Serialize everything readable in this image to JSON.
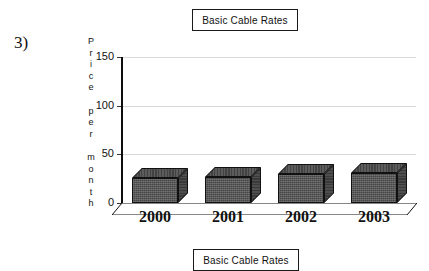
{
  "question_number": "3)",
  "chart_title_box": "Basic Cable Rates",
  "chart_caption_box": "Basic Cable Rates",
  "y_axis_title_letters": [
    "P",
    "r",
    "i",
    "c",
    "e",
    "",
    "p",
    "e",
    "r",
    "",
    "m",
    "o",
    "n",
    "t",
    "h"
  ],
  "chart_data": {
    "type": "bar",
    "title": "Basic Cable Rates",
    "xlabel": "",
    "ylabel": "Price per month",
    "categories": [
      "2000",
      "2001",
      "2002",
      "2003"
    ],
    "values": [
      26,
      27,
      30,
      31
    ],
    "yticks": [
      0,
      50,
      100,
      150
    ],
    "ylim": [
      0,
      150
    ],
    "grid": true,
    "legend": false,
    "style_3d": true,
    "bar_color": "#555555",
    "gridline_color": "#d9d9d9",
    "axis_color": "#0d0d0d"
  }
}
